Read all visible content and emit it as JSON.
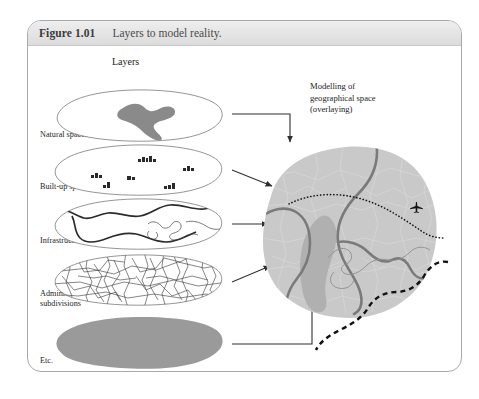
{
  "figure": {
    "number": "Figure 1.01",
    "caption": "Layers to model reality."
  },
  "headings": {
    "layers": "Layers"
  },
  "right_panel": {
    "line1": "Modelling of",
    "line2": "geographical  space",
    "line3": "(overlaying)"
  },
  "layers": [
    {
      "id": "natural-spaces",
      "label": "Natural spaces",
      "label2": ""
    },
    {
      "id": "built-up-spaces",
      "label": "Built-up spaces",
      "label2": ""
    },
    {
      "id": "infrastructures",
      "label": "Infrastructures",
      "label2": ""
    },
    {
      "id": "administrative",
      "label": "Administrative",
      "label2": "subdivisions"
    },
    {
      "id": "etc",
      "label": "Etc.",
      "label2": ""
    }
  ],
  "icons": {
    "airplane": "airplane-icon"
  },
  "colors": {
    "frame_border": "#a9a9a9",
    "title_bar": "#e4e4e4",
    "layer_outline": "#6b6b6b",
    "natural_fill": "#8a8a8a",
    "etc_fill": "#9a9a9a",
    "composite_fill": "#c9c9c9",
    "composite_natural_fill": "#b0b0b0",
    "road": "#7a7a7a",
    "boundary": "#111111",
    "arrow": "#333333"
  }
}
